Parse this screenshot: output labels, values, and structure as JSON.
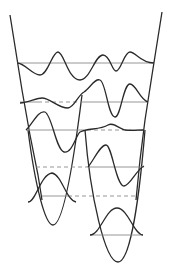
{
  "diagram": {
    "title": "",
    "colors": {
      "line": "#2a2a2a",
      "level": "#8a8a8a",
      "background": "#ffffff"
    },
    "outer_well": {
      "kind": "asymmetric-anharmonic"
    },
    "inner_wells": [
      {
        "name": "left-well",
        "levels": 1
      },
      {
        "name": "right-well",
        "levels": 2
      }
    ],
    "levels": [
      {
        "name": "level-top",
        "style": "solid"
      },
      {
        "name": "level-2",
        "style": "solid-and-dashed"
      },
      {
        "name": "level-3",
        "style": "solid-and-dashed"
      },
      {
        "name": "level-4",
        "style": "dashed"
      },
      {
        "name": "level-5",
        "style": "dashed"
      },
      {
        "name": "level-ground",
        "style": "solid"
      }
    ]
  }
}
